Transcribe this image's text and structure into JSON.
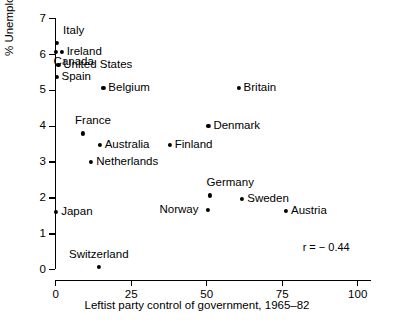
{
  "chart_data": {
    "type": "scatter",
    "title": "",
    "xlabel": "Leftist party control of government, 1965–82",
    "ylabel": "% Unemployed 1965–82",
    "xlim": [
      0,
      105
    ],
    "ylim": [
      0,
      7
    ],
    "xticks": [
      0,
      25,
      50,
      75,
      100
    ],
    "yticks": [
      0,
      1,
      2,
      3,
      4,
      5,
      6,
      7
    ],
    "xtick_labels": [
      "0",
      "25",
      "50",
      "75",
      "100"
    ],
    "ytick_labels": [
      "0",
      "1",
      "2",
      "3",
      "4",
      "5",
      "6",
      "7"
    ],
    "grid": false,
    "legend": false,
    "annotations": [
      {
        "text": "r = − 0.44",
        "x": 82,
        "y": 0.75
      }
    ],
    "points": [
      {
        "label": "Italy",
        "x": 0.7,
        "y": 6.3,
        "label_dx": 6,
        "label_dy": -12
      },
      {
        "label": "Ireland",
        "x": 2.2,
        "y": 6.05,
        "label_dx": 5,
        "label_dy": 0
      },
      {
        "label": "Canada",
        "x": 0.2,
        "y": 6.05,
        "label_dx": -2,
        "label_dy": 10
      },
      {
        "label": "United States",
        "x": 1.1,
        "y": 5.7,
        "label_dx": 5,
        "label_dy": 0
      },
      {
        "label": "Spain",
        "x": 0.5,
        "y": 5.35,
        "label_dx": 5,
        "label_dy": 0
      },
      {
        "label": "Belgium",
        "x": 16.0,
        "y": 5.05,
        "label_dx": 5,
        "label_dy": 0
      },
      {
        "label": "Britain",
        "x": 60.8,
        "y": 5.05,
        "label_dx": 5,
        "label_dy": 0
      },
      {
        "label": "Denmark",
        "x": 50.8,
        "y": 4.0,
        "label_dx": 5,
        "label_dy": 0
      },
      {
        "label": "France",
        "x": 9.3,
        "y": 3.78,
        "label_dx": -8,
        "label_dy": -12
      },
      {
        "label": "Australia",
        "x": 14.8,
        "y": 3.47,
        "label_dx": 5,
        "label_dy": 0
      },
      {
        "label": "Finland",
        "x": 38.0,
        "y": 3.47,
        "label_dx": 5,
        "label_dy": 0
      },
      {
        "label": "Netherlands",
        "x": 12.0,
        "y": 2.98,
        "label_dx": 5,
        "label_dy": 0
      },
      {
        "label": "Germany",
        "x": 51.2,
        "y": 2.05,
        "label_dx": -3,
        "label_dy": -12
      },
      {
        "label": "Sweden",
        "x": 62.0,
        "y": 1.95,
        "label_dx": 5,
        "label_dy": 0
      },
      {
        "label": "Norway",
        "x": 50.5,
        "y": 1.65,
        "label_dx": -48,
        "label_dy": 0
      },
      {
        "label": "Austria",
        "x": 76.5,
        "y": 1.62,
        "label_dx": 5,
        "label_dy": 0
      },
      {
        "label": "Japan",
        "x": 0.4,
        "y": 1.6,
        "label_dx": 5,
        "label_dy": 0
      },
      {
        "label": "Switzerland",
        "x": 14.6,
        "y": 0.06,
        "label_dx": -30,
        "label_dy": -12
      }
    ]
  }
}
